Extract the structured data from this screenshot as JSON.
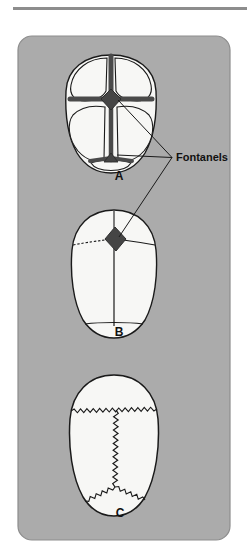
{
  "figure": {
    "kind": "anatomy-illustration",
    "panel": {
      "background_color": "#ababab",
      "border_color": "#8d8d8d",
      "corner_radius": 14,
      "x": 18,
      "y": 36,
      "width": 212,
      "height": 504
    },
    "page_background_color": "#ffffff",
    "top_rule": {
      "color": "#8d8d8d",
      "x": 13,
      "y": 7,
      "width": 234,
      "height": 3
    },
    "bone_fill_color": "#f7f7f5",
    "outline_color": "#1a1a1a",
    "suture_open_color": "#4a4a4a",
    "fontanel_color": "#454545",
    "leader_line_color": "#1a1a1a",
    "label_text_color": "#111111"
  },
  "callout": {
    "label": "Fontanels",
    "x": 176,
    "y": 161,
    "font_size": 11,
    "leader_targets": [
      {
        "name": "anterior-fontanel-skull-a",
        "x": 118,
        "y": 100
      },
      {
        "name": "posterior-fontanel-skull-a",
        "x": 117,
        "y": 155
      },
      {
        "name": "anterior-fontanel-skull-b",
        "x": 119,
        "y": 237
      }
    ]
  },
  "panels": [
    {
      "id": "a",
      "label": "A",
      "label_x": 119,
      "label_y": 180,
      "view": "superior view, newborn skull",
      "center_x": 111,
      "center_y": 113,
      "description": "Four cranial bone plates separated by wide open sutures; large diamond anterior fontanel at the junction.",
      "fontanels_visible": [
        "anterior",
        "posterior"
      ],
      "sutures": "wide, open, membranous"
    },
    {
      "id": "b",
      "label": "B",
      "label_x": 119,
      "label_y": 336,
      "view": "superior view, infant skull",
      "center_x": 114,
      "center_y": 272,
      "description": "Narrowed sutures with a small dark diamond-shaped anterior fontanel still patent.",
      "fontanels_visible": [
        "anterior"
      ],
      "sutures": "narrow, partially closed"
    },
    {
      "id": "c",
      "label": "C",
      "label_x": 120,
      "label_y": 517,
      "view": "superior view, child skull",
      "center_x": 114,
      "center_y": 443,
      "description": "Fontanels closed; sutures fused into interlocking serrated (zigzag) lines.",
      "fontanels_visible": [],
      "sutures": "fused, serrated"
    }
  ]
}
